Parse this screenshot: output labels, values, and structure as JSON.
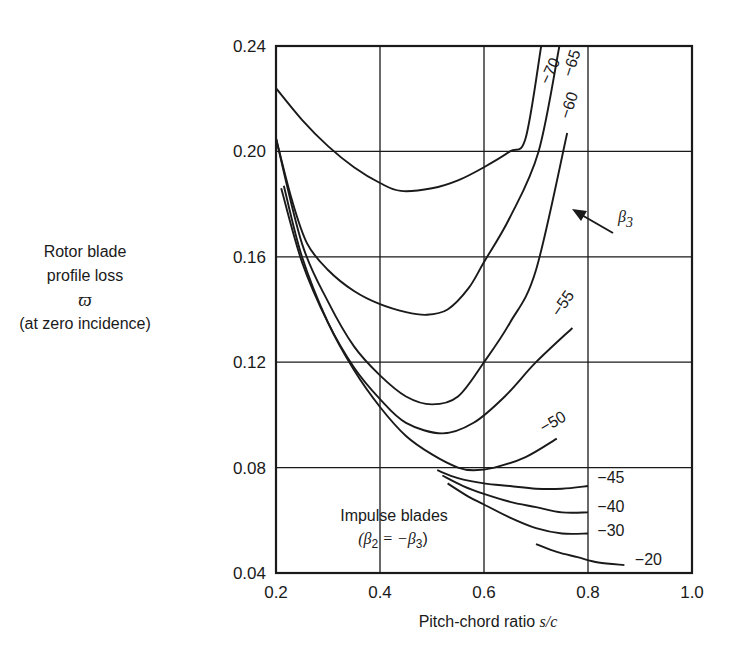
{
  "chart_data": {
    "type": "line",
    "title": "",
    "xlabel": "Pitch-chord ratio s/c",
    "xlabel_text": "Pitch-chord ratio ",
    "xlabel_var": "s/c",
    "ylabel_lines": [
      "Rotor blade",
      "profile loss",
      "ϖ",
      "(at zero incidence)"
    ],
    "xlim": [
      0.2,
      1.0
    ],
    "ylim": [
      0.04,
      0.24
    ],
    "xticks": [
      "0.2",
      "0.4",
      "0.6",
      "0.8",
      "1.0"
    ],
    "yticks": [
      "0.24",
      "0.20",
      "0.16",
      "0.12",
      "0.08",
      "0.04"
    ],
    "grid": true,
    "legend": "none (curves labeled inline)",
    "parameter": "β3 (blade outlet angle, deg)",
    "annotations": {
      "beta3_arrow_label": "β",
      "beta3_arrow_sub": "3",
      "impulse_line1": "Impulse blades",
      "impulse_line2_a": "(β",
      "impulse_line2_sub2": "2",
      "impulse_line2_b": " = −β",
      "impulse_line2_sub3": "3",
      "impulse_line2_c": ")"
    },
    "series": [
      {
        "name": "−70",
        "x": [
          0.2,
          0.25,
          0.3,
          0.35,
          0.4,
          0.44,
          0.5,
          0.55,
          0.6,
          0.65,
          0.68,
          0.71
        ],
        "y": [
          0.224,
          0.212,
          0.202,
          0.194,
          0.188,
          0.185,
          0.186,
          0.189,
          0.194,
          0.2,
          0.205,
          0.24
        ]
      },
      {
        "name": "−65",
        "x": [
          0.2,
          0.23,
          0.26,
          0.3,
          0.35,
          0.4,
          0.45,
          0.49,
          0.53,
          0.57,
          0.6,
          0.65,
          0.705,
          0.745
        ],
        "y": [
          0.205,
          0.182,
          0.165,
          0.155,
          0.147,
          0.142,
          0.139,
          0.138,
          0.14,
          0.148,
          0.158,
          0.175,
          0.2,
          0.24
        ]
      },
      {
        "name": "−60",
        "x": [
          0.2,
          0.25,
          0.3,
          0.35,
          0.4,
          0.45,
          0.5,
          0.55,
          0.6,
          0.65,
          0.7,
          0.76
        ],
        "y": [
          0.205,
          0.165,
          0.143,
          0.126,
          0.115,
          0.107,
          0.104,
          0.107,
          0.12,
          0.135,
          0.155,
          0.207
        ]
      },
      {
        "name": "−55",
        "x": [
          0.21,
          0.25,
          0.3,
          0.35,
          0.4,
          0.45,
          0.52,
          0.58,
          0.64,
          0.7,
          0.77
        ],
        "y": [
          0.186,
          0.158,
          0.135,
          0.118,
          0.106,
          0.097,
          0.093,
          0.097,
          0.107,
          0.12,
          0.133
        ]
      },
      {
        "name": "−50",
        "x": [
          0.215,
          0.25,
          0.3,
          0.35,
          0.4,
          0.45,
          0.5,
          0.55,
          0.58,
          0.62,
          0.68,
          0.74
        ],
        "y": [
          0.187,
          0.16,
          0.135,
          0.117,
          0.103,
          0.092,
          0.085,
          0.08,
          0.079,
          0.08,
          0.084,
          0.091
        ]
      },
      {
        "name": "−45",
        "x": [
          0.51,
          0.55,
          0.6,
          0.65,
          0.7,
          0.75,
          0.8
        ],
        "y": [
          0.079,
          0.076,
          0.074,
          0.073,
          0.072,
          0.072,
          0.073
        ]
      },
      {
        "name": "−40",
        "x": [
          0.52,
          0.56,
          0.6,
          0.65,
          0.7,
          0.75,
          0.8
        ],
        "y": [
          0.077,
          0.073,
          0.07,
          0.067,
          0.065,
          0.063,
          0.063
        ]
      },
      {
        "name": "−30",
        "x": [
          0.53,
          0.57,
          0.6,
          0.65,
          0.7,
          0.75,
          0.8
        ],
        "y": [
          0.074,
          0.069,
          0.066,
          0.061,
          0.057,
          0.055,
          0.055
        ]
      },
      {
        "name": "−20",
        "x": [
          0.7,
          0.74,
          0.78,
          0.82,
          0.87
        ],
        "y": [
          0.051,
          0.048,
          0.046,
          0.044,
          0.043
        ]
      }
    ],
    "curve_labels": [
      {
        "text": "−70",
        "x": 0.725,
        "y": 0.225,
        "rotate": -65
      },
      {
        "text": "−65",
        "x": 0.77,
        "y": 0.228,
        "rotate": -72
      },
      {
        "text": "−60",
        "x": 0.765,
        "y": 0.212,
        "rotate": -72
      },
      {
        "text": "−55",
        "x": 0.745,
        "y": 0.137,
        "rotate": -55
      },
      {
        "text": "−50",
        "x": 0.715,
        "y": 0.093,
        "rotate": -30
      },
      {
        "text": "−45",
        "x": 0.818,
        "y": 0.074,
        "rotate": 0
      },
      {
        "text": "−40",
        "x": 0.818,
        "y": 0.063,
        "rotate": 0
      },
      {
        "text": "−30",
        "x": 0.818,
        "y": 0.054,
        "rotate": 0
      },
      {
        "text": "−20",
        "x": 0.89,
        "y": 0.043,
        "rotate": 0
      }
    ]
  }
}
